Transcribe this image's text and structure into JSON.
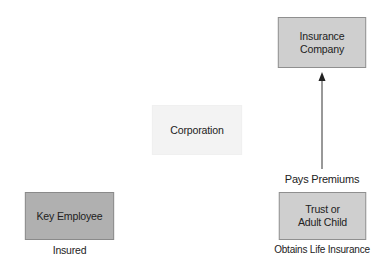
{
  "diagram": {
    "nodes": [
      {
        "id": "insurance-company",
        "lines": [
          "Insurance",
          "Company"
        ],
        "fill": "#cfcfcf"
      },
      {
        "id": "corporation",
        "lines": [
          "Corporation"
        ],
        "fill": "#f3f3f3"
      },
      {
        "id": "key-employee",
        "lines": [
          "Key Employee"
        ],
        "fill": "#b0b0b0",
        "caption": "Insured"
      },
      {
        "id": "trust-or-adult-child",
        "lines": [
          "Trust or",
          "Adult Child"
        ],
        "fill": "#cfcfcf",
        "caption": "Obtains Life Insurance"
      }
    ],
    "edges": [
      {
        "from": "trust-or-adult-child",
        "to": "insurance-company",
        "label": "Pays Premiums",
        "arrow": "end"
      }
    ]
  }
}
